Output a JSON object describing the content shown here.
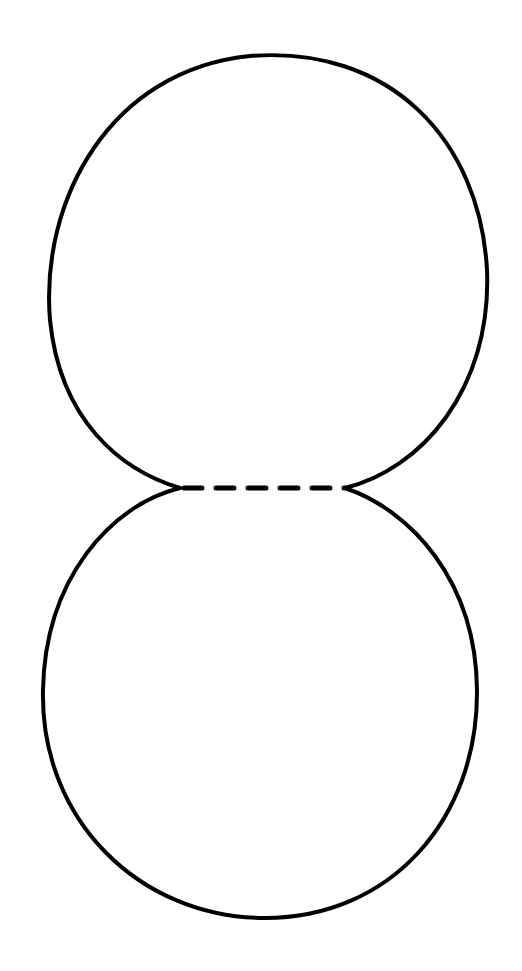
{
  "diagram": {
    "stroke_color": "#000000",
    "background_color": "#ffffff",
    "shapes": [
      {
        "id": "top-circle",
        "type": "circle-arc",
        "cx": 266,
        "cy": 272
      },
      {
        "id": "bottom-circle",
        "type": "circle-arc",
        "cx": 260,
        "cy": 704
      },
      {
        "id": "dashed-line",
        "type": "dashed-line",
        "x1": 180,
        "x2": 345,
        "y": 488,
        "dash_count": 5
      }
    ]
  }
}
